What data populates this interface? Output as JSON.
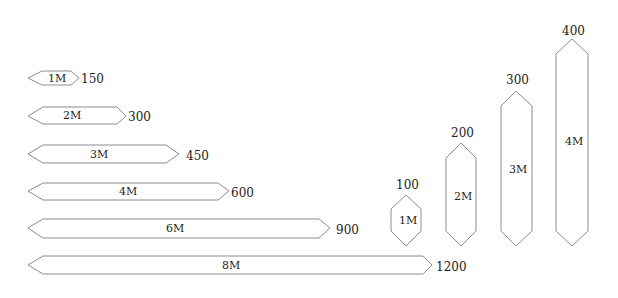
{
  "diagram": {
    "stroke_color": "#8c8c8c",
    "text_color": "#222222",
    "horizontal_bars": [
      {
        "label": "1M",
        "value": "150"
      },
      {
        "label": "2M",
        "value": "300"
      },
      {
        "label": "3M",
        "value": "450"
      },
      {
        "label": "4M",
        "value": "600"
      },
      {
        "label": "6M",
        "value": "900"
      },
      {
        "label": "8M",
        "value": "1200"
      }
    ],
    "vertical_bars": [
      {
        "label": "1M",
        "value": "100"
      },
      {
        "label": "2M",
        "value": "200"
      },
      {
        "label": "3M",
        "value": "300"
      },
      {
        "label": "4M",
        "value": "400"
      }
    ]
  }
}
